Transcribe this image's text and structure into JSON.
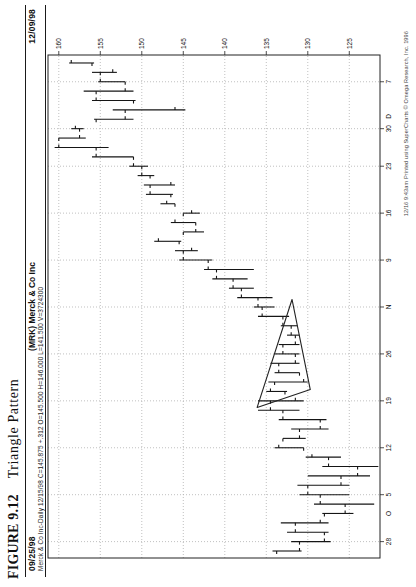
{
  "figure": {
    "label": "FIGURE 9.12",
    "title": "Triangle Pattern"
  },
  "header": {
    "left_date": "09/25/98",
    "title": "(MRK) Merck & Co Inc",
    "right_date": "12/09/98",
    "quote_line": "Merck & Co Inc-Daily 12/15/98 C=145.875 +.312 O=145.500 H=146.000 L=141.500 V=3724300"
  },
  "footer": {
    "print_info": "12/16 9:43am Printed using SuperCharts © Omega Research, Inc. 1996"
  },
  "colors": {
    "bar": "#151515",
    "grid": "#b0b0b0",
    "frame": "#222222",
    "triangle": "#222222",
    "axis_text": "#111111"
  },
  "chart_data": {
    "type": "bar",
    "subtype": "ohlc-daily",
    "title": "(MRK) Merck & Co Inc",
    "price_axis": {
      "position": "right",
      "ticks": [
        160,
        155,
        150,
        145,
        140,
        135,
        130,
        125
      ],
      "range": [
        121.3,
        161.3
      ]
    },
    "time_axis": {
      "start": "09/25/98",
      "end": "12/09/98",
      "labels": [
        {
          "text": "28",
          "bar": 1
        },
        {
          "text": "O",
          "bar": 4
        },
        {
          "text": "5",
          "bar": 6
        },
        {
          "text": "12",
          "bar": 11
        },
        {
          "text": "19",
          "bar": 16
        },
        {
          "text": "26",
          "bar": 21
        },
        {
          "text": "N",
          "bar": 26
        },
        {
          "text": "9",
          "bar": 31
        },
        {
          "text": "16",
          "bar": 36
        },
        {
          "text": "23",
          "bar": 41
        },
        {
          "text": "30",
          "bar": 45
        },
        {
          "text": "D",
          "bar": 46.3
        },
        {
          "text": "7",
          "bar": 50
        }
      ],
      "week_gridline_bars": [
        1,
        6,
        11,
        16,
        21,
        26,
        31,
        36,
        41,
        45,
        50
      ]
    },
    "triangle_overlay": {
      "points": [
        {
          "bar": 15.3,
          "price": 136.1
        },
        {
          "bar": 17.2,
          "price": 129.7
        },
        {
          "bar": 26.8,
          "price": 131.9
        }
      ]
    },
    "bars": [
      {
        "d": "09/25",
        "o": 133.75,
        "h": 134.25,
        "l": 130.75,
        "c": 131.0
      },
      {
        "d": "09/28",
        "o": 131.0,
        "h": 132.0,
        "l": 127.25,
        "c": 128.0
      },
      {
        "d": "09/29",
        "o": 128.0,
        "h": 132.5,
        "l": 127.5,
        "c": 131.5
      },
      {
        "d": "09/30",
        "o": 131.5,
        "h": 133.25,
        "l": 127.5,
        "c": 128.5
      },
      {
        "d": "10/01",
        "o": 128.0,
        "h": 128.25,
        "l": 124.5,
        "c": 125.5
      },
      {
        "d": "10/02",
        "o": 125.5,
        "h": 129.25,
        "l": 122.0,
        "c": 128.5
      },
      {
        "d": "10/05",
        "o": 128.5,
        "h": 131.0,
        "l": 125.0,
        "c": 130.0
      },
      {
        "d": "10/06",
        "o": 130.0,
        "h": 131.25,
        "l": 125.0,
        "c": 126.0
      },
      {
        "d": "10/07",
        "o": 126.0,
        "h": 130.0,
        "l": 122.5,
        "c": 124.0
      },
      {
        "d": "10/08",
        "o": 124.0,
        "h": 128.25,
        "l": 121.5,
        "c": 127.5
      },
      {
        "d": "10/09",
        "o": 127.5,
        "h": 130.25,
        "l": 126.0,
        "c": 129.5
      },
      {
        "d": "10/12",
        "o": 130.5,
        "h": 134.0,
        "l": 130.5,
        "c": 133.5
      },
      {
        "d": "10/13",
        "o": 133.0,
        "h": 133.0,
        "l": 130.25,
        "c": 131.0
      },
      {
        "d": "10/14",
        "o": 131.0,
        "h": 132.0,
        "l": 127.5,
        "c": 128.5
      },
      {
        "d": "10/15",
        "o": 128.5,
        "h": 133.5,
        "l": 127.75,
        "c": 133.0
      },
      {
        "d": "10/16",
        "o": 133.0,
        "h": 136.0,
        "l": 131.0,
        "c": 134.5
      },
      {
        "d": "10/19",
        "o": 134.5,
        "h": 136.0,
        "l": 130.5,
        "c": 131.5
      },
      {
        "d": "10/20",
        "o": 132.75,
        "h": 135.0,
        "l": 132.5,
        "c": 134.5
      },
      {
        "d": "10/21",
        "o": 134.0,
        "h": 134.75,
        "l": 130.0,
        "c": 130.5
      },
      {
        "d": "10/22",
        "o": 131.0,
        "h": 134.0,
        "l": 131.0,
        "c": 133.5
      },
      {
        "d": "10/23",
        "o": 133.5,
        "h": 134.5,
        "l": 131.0,
        "c": 131.5
      },
      {
        "d": "10/26",
        "o": 131.5,
        "h": 134.0,
        "l": 131.0,
        "c": 133.0
      },
      {
        "d": "10/27",
        "o": 133.0,
        "h": 133.5,
        "l": 131.0,
        "c": 131.5
      },
      {
        "d": "10/28",
        "o": 131.5,
        "h": 132.5,
        "l": 131.0,
        "c": 132.0
      },
      {
        "d": "10/29",
        "o": 132.0,
        "h": 133.25,
        "l": 131.25,
        "c": 133.0
      },
      {
        "d": "10/30",
        "o": 133.0,
        "h": 136.0,
        "l": 132.25,
        "c": 135.5
      },
      {
        "d": "11/02",
        "o": 135.5,
        "h": 136.5,
        "l": 134.0,
        "c": 136.0
      },
      {
        "d": "11/03",
        "o": 136.0,
        "h": 138.5,
        "l": 134.25,
        "c": 138.0
      },
      {
        "d": "11/04",
        "o": 138.0,
        "h": 139.5,
        "l": 136.5,
        "c": 139.0
      },
      {
        "d": "11/05",
        "o": 139.0,
        "h": 141.5,
        "l": 137.25,
        "c": 141.0
      },
      {
        "d": "11/06",
        "o": 141.0,
        "h": 142.5,
        "l": 136.5,
        "c": 142.0
      },
      {
        "d": "11/09",
        "o": 142.0,
        "h": 145.5,
        "l": 141.5,
        "c": 145.0
      },
      {
        "d": "11/10",
        "o": 145.0,
        "h": 146.0,
        "l": 143.25,
        "c": 144.0
      },
      {
        "d": "11/11",
        "o": 145.5,
        "h": 148.5,
        "l": 145.25,
        "c": 148.0
      },
      {
        "d": "11/12",
        "o": 145.0,
        "h": 145.0,
        "l": 142.5,
        "c": 143.5
      },
      {
        "d": "11/13",
        "o": 143.5,
        "h": 146.5,
        "l": 143.5,
        "c": 146.0
      },
      {
        "d": "11/16",
        "o": 145.0,
        "h": 145.0,
        "l": 143.0,
        "c": 144.0
      },
      {
        "d": "11/17",
        "o": 146.0,
        "h": 147.75,
        "l": 146.0,
        "c": 147.0
      },
      {
        "d": "11/18",
        "o": 146.5,
        "h": 149.5,
        "l": 146.25,
        "c": 149.0
      },
      {
        "d": "11/19",
        "o": 149.0,
        "h": 149.75,
        "l": 146.0,
        "c": 146.5
      },
      {
        "d": "11/20",
        "o": 149.0,
        "h": 150.5,
        "l": 148.5,
        "c": 150.0
      },
      {
        "d": "11/23",
        "o": 150.0,
        "h": 151.5,
        "l": 149.25,
        "c": 151.0
      },
      {
        "d": "11/24",
        "o": 151.0,
        "h": 156.0,
        "l": 151.0,
        "c": 155.5
      },
      {
        "d": "11/25",
        "o": 155.5,
        "h": 160.5,
        "l": 154.0,
        "c": 160.0
      },
      {
        "d": "11/27",
        "o": 160.0,
        "h": 160.0,
        "l": 156.75,
        "c": 157.5
      },
      {
        "d": "11/30",
        "o": 157.5,
        "h": 158.5,
        "l": 157.0,
        "c": 158.0
      },
      {
        "d": "12/01",
        "o": 155.5,
        "h": 155.75,
        "l": 151.0,
        "c": 152.0
      },
      {
        "d": "12/02",
        "o": 152.0,
        "h": 153.5,
        "l": 144.75,
        "c": 146.0
      },
      {
        "d": "12/03",
        "o": 151.0,
        "h": 156.0,
        "l": 150.75,
        "c": 155.5
      },
      {
        "d": "12/04",
        "o": 155.5,
        "h": 157.0,
        "l": 151.0,
        "c": 152.0
      },
      {
        "d": "12/07",
        "o": 152.0,
        "h": 155.25,
        "l": 152.0,
        "c": 155.0
      },
      {
        "d": "12/08",
        "o": 155.0,
        "h": 156.0,
        "l": 153.0,
        "c": 153.5
      },
      {
        "d": "12/09",
        "o": 156.0,
        "h": 158.75,
        "l": 155.75,
        "c": 158.5
      }
    ]
  }
}
